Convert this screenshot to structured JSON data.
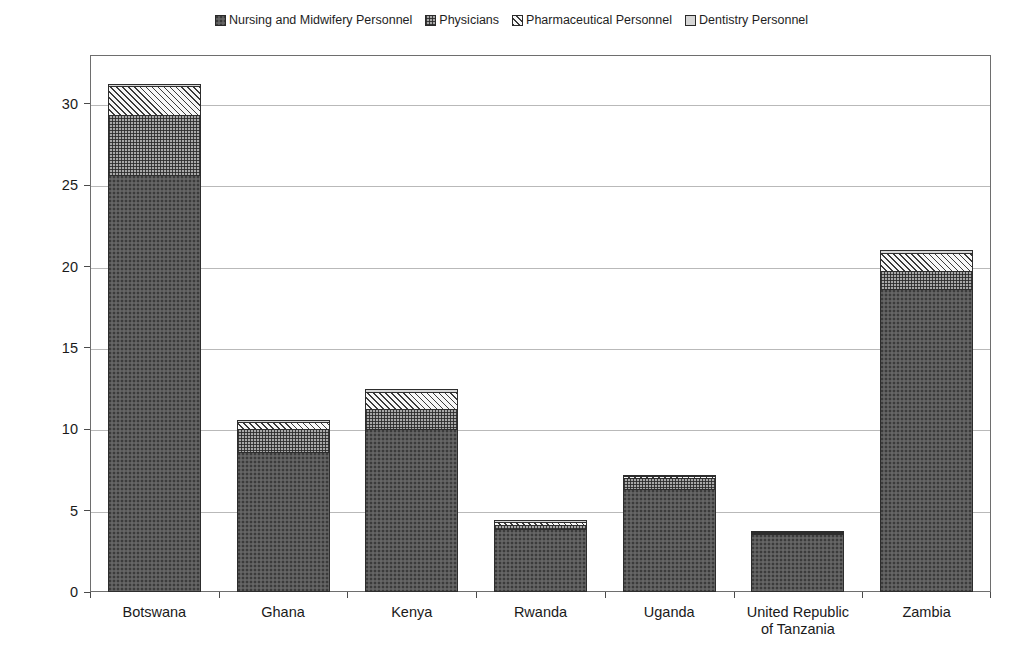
{
  "chart_data": {
    "type": "bar",
    "subtype": "stacked-bar",
    "title": "",
    "xlabel": "",
    "ylabel": "Number of Healthcare Workers per 10,000 population",
    "ylim": [
      0,
      33
    ],
    "yticks": [
      0,
      5,
      10,
      15,
      20,
      25,
      30
    ],
    "ytick_labels": [
      "0",
      "5",
      "10",
      "15",
      "20",
      "25",
      "30"
    ],
    "grid": true,
    "legend_position": "top-center",
    "categories": [
      "Botswana",
      "Ghana",
      "Kenya",
      "Rwanda",
      "Uganda",
      "United Republic of Tanzania",
      "Zambia"
    ],
    "category_lines": [
      [
        "Botswana"
      ],
      [
        "Ghana"
      ],
      [
        "Kenya"
      ],
      [
        "Rwanda"
      ],
      [
        "Uganda"
      ],
      [
        "United Republic",
        "of Tanzania"
      ],
      [
        "Zambia"
      ]
    ],
    "series": [
      {
        "name": "Nursing and Midwifery Personnel",
        "fill": "fill-nursing",
        "color": "#5b5b5b",
        "values": [
          25.6,
          8.6,
          10.0,
          3.9,
          6.3,
          3.55,
          18.6
        ]
      },
      {
        "name": "Physicians",
        "fill": "fill-physicians",
        "color": "#a8a8a8",
        "values": [
          3.8,
          1.5,
          1.3,
          0.25,
          0.75,
          0.08,
          1.2
        ]
      },
      {
        "name": "Pharmaceutical Personnel",
        "fill": "fill-pharma",
        "color": "#f2f2f2",
        "values": [
          1.8,
          0.45,
          1.1,
          0.3,
          0.2,
          0.05,
          1.15
        ]
      },
      {
        "name": "Dentistry Personnel",
        "fill": "fill-dentistry",
        "color": "#d6d6d6",
        "values": [
          0.2,
          0.2,
          0.25,
          0.15,
          0.15,
          0.02,
          0.25
        ]
      }
    ],
    "totals": [
      31.4,
      10.75,
      12.65,
      4.6,
      7.4,
      3.7,
      21.2
    ]
  },
  "legend": {
    "items": [
      {
        "label": "Nursing and Midwifery Personnel",
        "swatch": "fill-nursing"
      },
      {
        "label": "Physicians",
        "swatch": "fill-physicians"
      },
      {
        "label": "Pharmaceutical Personnel",
        "swatch": "fill-pharma"
      },
      {
        "label": "Dentistry Personnel",
        "swatch": "fill-dentistry"
      }
    ]
  }
}
